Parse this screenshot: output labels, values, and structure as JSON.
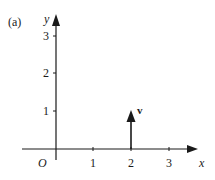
{
  "figure": {
    "label": "(a)",
    "x_axis_label": "x",
    "y_axis_label": "y",
    "origin_label": "O",
    "x_ticks": [
      "1",
      "2",
      "3"
    ],
    "y_ticks": [
      "1",
      "2",
      "3"
    ],
    "vector": {
      "label": "v",
      "from": [
        2,
        0
      ],
      "to": [
        2,
        1
      ]
    },
    "color": "#1a1a1a"
  }
}
